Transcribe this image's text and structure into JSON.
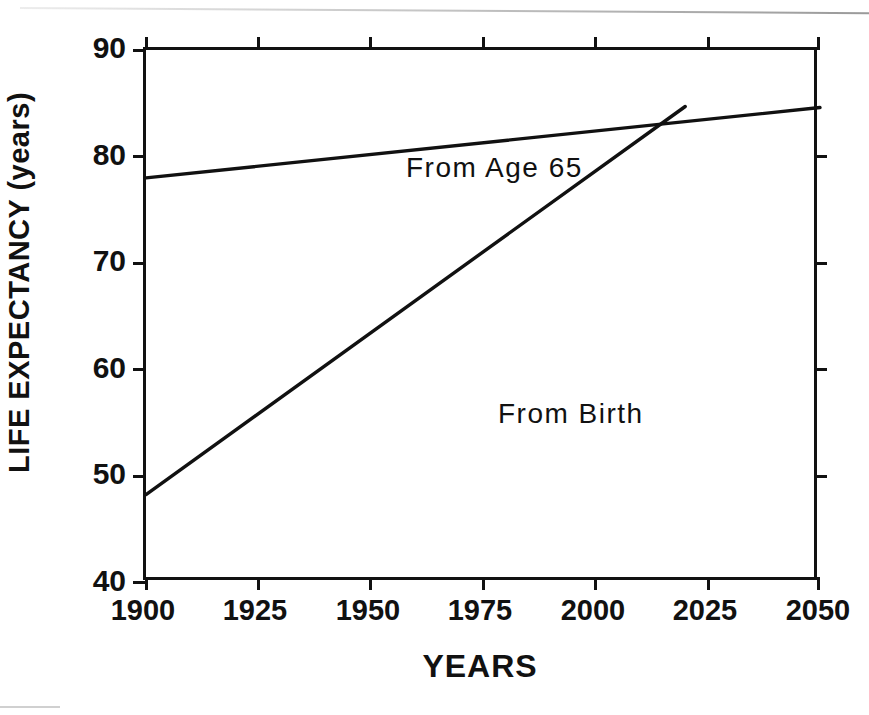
{
  "figure": {
    "background_color": "#ffffff",
    "ink_color": "#111111"
  },
  "chart_data": {
    "type": "line",
    "title": "",
    "subtitle": "",
    "xlabel": "YEARS",
    "ylabel": "LIFE EXPECTANCY (years)",
    "xlim": [
      1900,
      2050
    ],
    "ylim": [
      40,
      90
    ],
    "xticks": [
      1900,
      1925,
      1950,
      1975,
      2000,
      2025,
      2050
    ],
    "xtick_labels": [
      "1900",
      "1925",
      "1950",
      "1975",
      "2000",
      "2025",
      "2050"
    ],
    "yticks": [
      40,
      50,
      60,
      70,
      80,
      90
    ],
    "ytick_labels": [
      "40",
      "50",
      "60",
      "70",
      "80",
      "90"
    ],
    "grid": false,
    "legend_position": "inline-annotations",
    "series": [
      {
        "name": "From Age 65",
        "annotation": "From Age 65",
        "x": [
          1900,
          2050
        ],
        "values": [
          78.0,
          84.6
        ],
        "style": "solid"
      },
      {
        "name": "From Birth",
        "annotation": "From Birth",
        "x": [
          1900,
          2020
        ],
        "values": [
          48.3,
          84.7
        ],
        "style": "solid"
      }
    ],
    "annotations": [
      {
        "text": "From Age 65",
        "x": 1926,
        "y": 82.6
      },
      {
        "text": "From Birth",
        "x": 1947,
        "y": 59.6
      }
    ]
  },
  "axes": {
    "x_title": "YEARS",
    "y_title": "LIFE EXPECTANCY (years)"
  },
  "caption": {
    "text": ""
  }
}
